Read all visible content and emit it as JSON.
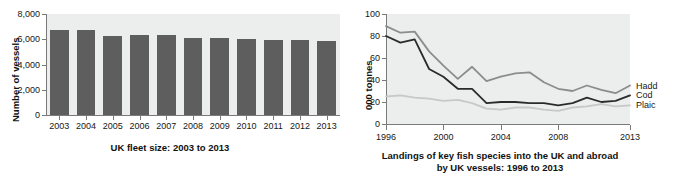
{
  "chart_data": [
    {
      "type": "bar",
      "title": "UK fleet size: 2003 to 2013",
      "xlabel": "",
      "ylabel": "Number of vessels",
      "categories": [
        "2003",
        "2004",
        "2005",
        "2006",
        "2007",
        "2008",
        "2009",
        "2010",
        "2011",
        "2012",
        "2013"
      ],
      "values": [
        6750,
        6760,
        6240,
        6340,
        6330,
        6080,
        6060,
        6050,
        5950,
        5940,
        5850
      ],
      "ytick_labels": [
        "0",
        "2,000",
        "4,000",
        "6,000",
        "8,000"
      ],
      "ytick_values": [
        0,
        2000,
        4000,
        6000,
        8000
      ],
      "ylim": [
        0,
        8000
      ],
      "grid": false,
      "legend": "none",
      "bar_color": "#5e5e5e",
      "plot_bg": "#eceded"
    },
    {
      "type": "line",
      "title": "Landings of key fish species into the UK and abroad by UK vessels: 1996 to 2013",
      "title_line1": "Landings of key fish species into the UK and abroad",
      "title_line2": "by UK vessels: 1996 to 2013",
      "xlabel": "",
      "ylabel": "000 tonnes",
      "x": [
        1996,
        1997,
        1998,
        1999,
        2000,
        2001,
        2002,
        2003,
        2004,
        2005,
        2006,
        2007,
        2008,
        2009,
        2010,
        2011,
        2012,
        2013
      ],
      "xtick_labels": [
        "1996",
        "2000",
        "2004",
        "2008",
        "2013"
      ],
      "xtick_values": [
        1996,
        2000,
        2004,
        2008,
        2013
      ],
      "ytick_labels": [
        "0",
        "20",
        "40",
        "60",
        "80",
        "100"
      ],
      "ytick_values": [
        0,
        20,
        40,
        60,
        80,
        100
      ],
      "ylim": [
        0,
        100
      ],
      "xlim": [
        1996,
        2013
      ],
      "grid": false,
      "legend": "right",
      "plot_bg": "#eceded",
      "series": [
        {
          "name": "Haddock",
          "label": "Hadd",
          "color": "#8c8c8c",
          "values": [
            89,
            83,
            84,
            66,
            53,
            41,
            52,
            39,
            43,
            46,
            47,
            38,
            32,
            30,
            35,
            31,
            28,
            35
          ]
        },
        {
          "name": "Cod",
          "label": "Cod",
          "color": "#2b2b2b",
          "values": [
            80,
            74,
            77,
            50,
            43,
            32,
            32,
            19,
            20,
            20,
            19,
            19,
            17,
            19,
            24,
            20,
            21,
            26
          ]
        },
        {
          "name": "Plaice",
          "label": "Plaic",
          "color": "#c8c8c8",
          "values": [
            25,
            26,
            24,
            23,
            21,
            22,
            19,
            14,
            13,
            15,
            15,
            13,
            12,
            15,
            16,
            18,
            16,
            17
          ]
        }
      ]
    }
  ]
}
